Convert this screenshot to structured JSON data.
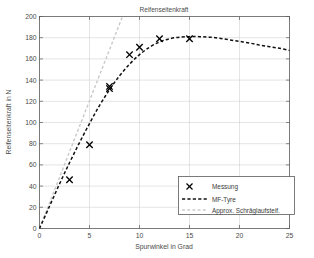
{
  "chart_data": {
    "type": "line",
    "title": "Reifenseitenkraft",
    "xlabel": "Spurwinkel in Grad",
    "ylabel": "Reifenseitenkraft in N",
    "xlim": [
      0,
      25
    ],
    "ylim": [
      0,
      200
    ],
    "xticks": [
      0,
      5,
      10,
      15,
      20,
      25
    ],
    "yticks": [
      0,
      20,
      40,
      60,
      80,
      100,
      120,
      140,
      160,
      180,
      200
    ],
    "grid": true,
    "legend_position": "lower-right",
    "series": [
      {
        "name": "Messung",
        "type": "scatter",
        "marker": "x",
        "color": "#000000",
        "x": [
          3,
          5,
          7,
          7,
          9,
          10,
          12,
          15
        ],
        "y": [
          46,
          79,
          132,
          134,
          164,
          171,
          179,
          179
        ]
      },
      {
        "name": "MF-Tyre",
        "type": "line",
        "style": "dashed",
        "color": "#111111",
        "x": [
          0,
          1,
          2,
          3,
          4,
          5,
          6,
          7,
          8,
          9,
          10,
          11,
          12,
          13,
          14,
          15,
          16,
          17,
          18,
          19,
          20,
          21,
          22,
          23,
          24,
          25
        ],
        "y": [
          0,
          21,
          42,
          62,
          81,
          99,
          116,
          131,
          144,
          155,
          164,
          171,
          176,
          179,
          180.5,
          181,
          181,
          180.5,
          179.5,
          178,
          176.5,
          175,
          173,
          171.5,
          170,
          168
        ]
      },
      {
        "name": "Approx. Schräglaufsteif.",
        "type": "line",
        "style": "dashed",
        "color": "#c9c9c9",
        "x": [
          0,
          8.3
        ],
        "y": [
          0,
          200
        ]
      }
    ],
    "legend_entries": [
      {
        "label": "Messung",
        "glyph": "x-marker"
      },
      {
        "label": "MF-Tyre",
        "glyph": "dashed-line-black"
      },
      {
        "label": "Approx. Schräglaufsteif.",
        "glyph": "dashed-line-grey"
      }
    ]
  }
}
